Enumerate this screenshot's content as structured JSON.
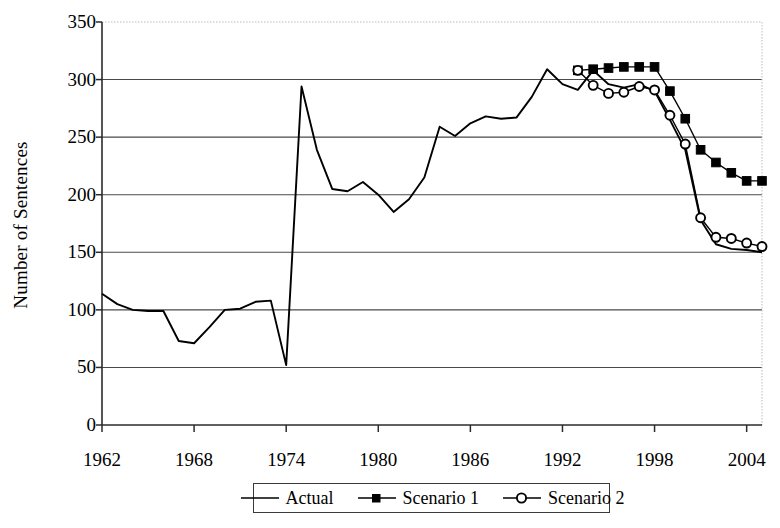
{
  "chart_data": {
    "type": "line",
    "title": "",
    "xlabel": "",
    "ylabel": "Number of Sentences",
    "xlim": [
      1962,
      2005
    ],
    "ylim": [
      0,
      350
    ],
    "ytick_labels": [
      "350",
      "300",
      "250",
      "200",
      "150",
      "100",
      "50",
      "0"
    ],
    "ytick_values": [
      350,
      300,
      250,
      200,
      150,
      100,
      50,
      0
    ],
    "xtick_labels": [
      "1962",
      "1968",
      "1974",
      "1980",
      "1986",
      "1992",
      "1998",
      "2004"
    ],
    "xtick_values": [
      1962,
      1968,
      1974,
      1980,
      1986,
      1992,
      1998,
      2004
    ],
    "grid": "horizontal",
    "legend_position": "bottom-center",
    "series": [
      {
        "name": "Actual",
        "marker": "none",
        "color": "#000000",
        "x": [
          1962,
          1963,
          1964,
          1965,
          1966,
          1967,
          1968,
          1969,
          1970,
          1971,
          1972,
          1973,
          1974,
          1975,
          1976,
          1977,
          1978,
          1979,
          1980,
          1981,
          1982,
          1983,
          1984,
          1985,
          1986,
          1987,
          1988,
          1989,
          1990,
          1991,
          1992,
          1993,
          1994,
          1995,
          1996,
          1997,
          1998,
          1999,
          2000,
          2001,
          2002,
          2003,
          2004,
          2005
        ],
        "values": [
          114,
          105,
          100,
          99,
          99,
          73,
          71,
          85,
          100,
          101,
          107,
          108,
          52,
          294,
          239,
          205,
          203,
          211,
          200,
          185,
          196,
          215,
          259,
          251,
          262,
          268,
          266,
          267,
          285,
          309,
          296,
          291,
          308,
          296,
          293,
          296,
          290,
          265,
          239,
          178,
          157,
          153,
          152,
          150
        ]
      },
      {
        "name": "Scenario 1",
        "marker": "filled-square",
        "color": "#000000",
        "x": [
          1993,
          1994,
          1995,
          1996,
          1997,
          1998,
          1999,
          2000,
          2001,
          2002,
          2003,
          2004,
          2005
        ],
        "values": [
          308,
          309,
          310,
          311,
          311,
          311,
          290,
          266,
          239,
          228,
          219,
          212,
          212
        ]
      },
      {
        "name": "Scenario 2",
        "marker": "open-circle",
        "color": "#000000",
        "x": [
          1993,
          1994,
          1995,
          1996,
          1997,
          1998,
          1999,
          2000,
          2001,
          2002,
          2003,
          2004,
          2005
        ],
        "values": [
          308,
          295,
          288,
          289,
          294,
          291,
          269,
          244,
          180,
          163,
          162,
          158,
          155
        ]
      }
    ],
    "annotations": []
  },
  "axes": {
    "ylabel": "Number of Sentences"
  },
  "legend": {
    "entries": [
      {
        "label": "Actual",
        "marker": "line"
      },
      {
        "label": "Scenario 1",
        "marker": "filled-square"
      },
      {
        "label": "Scenario 2",
        "marker": "open-circle"
      }
    ]
  }
}
